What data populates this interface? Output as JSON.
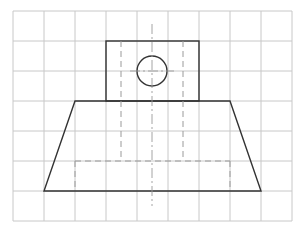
{
  "diagram": {
    "title": "",
    "type": "orthographic-view-on-grid",
    "colors": {
      "background": "#ffffff",
      "grid": "#c8c8c8",
      "outline": "#333333",
      "hidden": "#9a9a9a",
      "center": "#9a9a9a"
    },
    "grid": {
      "x0": 13,
      "y0": 11,
      "columns": 9,
      "rows": 7,
      "cell_w": 31,
      "cell_h": 30
    },
    "shapes": {
      "boss_rect": {
        "x": 106,
        "y": 41,
        "w": 93,
        "h": 60
      },
      "hole_circle": {
        "cx": 152,
        "cy": 71,
        "r": 15
      },
      "base_trapezoid": {
        "points": "75,101 230,101 261,191 44,191"
      },
      "hidden_lines": [
        {
          "x1": 121,
          "y1": 41,
          "x2": 121,
          "y2": 161
        },
        {
          "x1": 183,
          "y1": 41,
          "x2": 183,
          "y2": 161
        },
        {
          "x1": 75,
          "y1": 161,
          "x2": 230,
          "y2": 161
        },
        {
          "x1": 75,
          "y1": 161,
          "x2": 75,
          "y2": 191
        },
        {
          "x1": 230,
          "y1": 161,
          "x2": 230,
          "y2": 191
        }
      ],
      "center_lines": [
        {
          "x1": 152,
          "y1": 24,
          "x2": 152,
          "y2": 206
        },
        {
          "x1": 130,
          "y1": 71,
          "x2": 174,
          "y2": 71
        }
      ]
    }
  }
}
